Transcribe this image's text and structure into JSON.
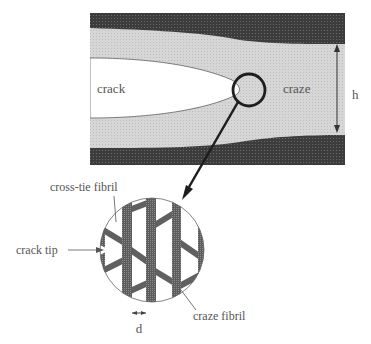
{
  "diagram": {
    "type": "craze-crack schematic",
    "labels": {
      "crack": "crack",
      "craze": "craze",
      "height": "h",
      "cross_tie": "cross-tie fibril",
      "crack_tip": "crack tip",
      "craze_fibril": "craze fibril",
      "spacing": "d"
    },
    "colors": {
      "bulk": "#3a3a3a",
      "craze_region": "#d2d2d2",
      "crack": "#ffffff",
      "fibril": "#5a5a5a",
      "outline": "#222222",
      "text": "#555555"
    }
  }
}
